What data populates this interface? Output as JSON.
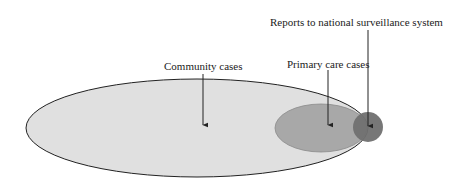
{
  "diagram": {
    "labels": {
      "community": "Community cases",
      "primary": "Primary care cases",
      "reports": "Reports to national surveillance system"
    },
    "colors": {
      "community_fill": "#e0e0e0",
      "primary_fill": "#a8a8a8",
      "reports_fill": "#707070",
      "outline": "#222222",
      "arrow": "#222222"
    }
  }
}
